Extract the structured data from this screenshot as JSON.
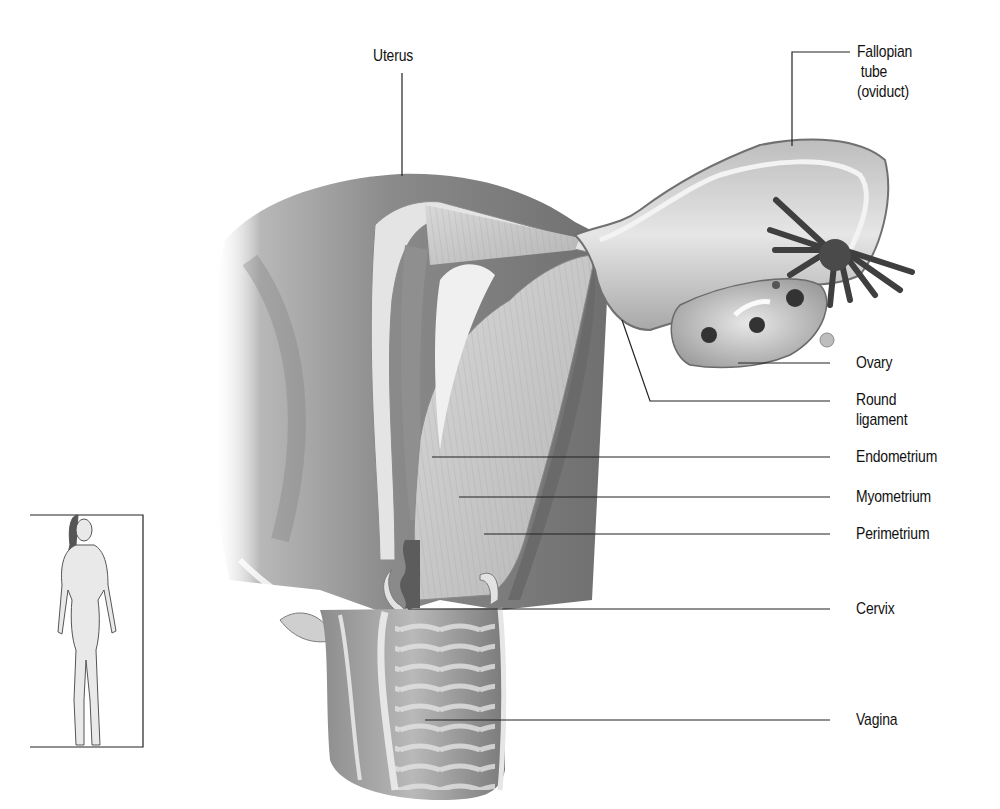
{
  "diagram": {
    "labels": {
      "uterus": "Uterus",
      "fallopian_tube": [
        "Fallopian",
        " tube",
        "(oviduct)"
      ],
      "ovary": "Ovary",
      "round_ligament": [
        "Round",
        "ligament"
      ],
      "endometrium": "Endometrium",
      "myometrium": "Myometrium",
      "perimetrium": "Perimetrium",
      "cervix": "Cervix",
      "vagina": "Vagina"
    },
    "inset": {
      "description": "Full-body female figure locator with bracket"
    },
    "colors": {
      "background": "#ffffff",
      "ink": "#111111",
      "tissue_dark": "#6e6e6e",
      "tissue_mid": "#9a9a9a",
      "tissue_light": "#d6d6d6"
    }
  }
}
